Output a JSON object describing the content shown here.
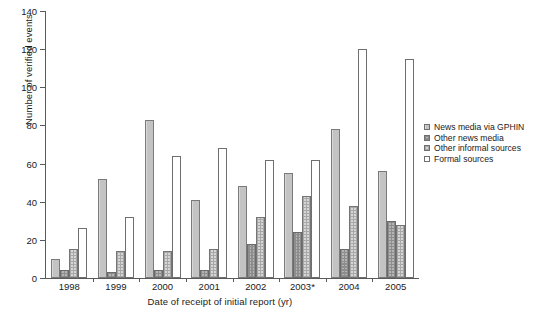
{
  "chart_data": {
    "type": "bar",
    "title": "",
    "xlabel": "Date of receipt of initial report (yr)",
    "ylabel": "Number of verified events",
    "categories": [
      "1998",
      "1999",
      "2000",
      "2001",
      "2002",
      "2003*",
      "2004",
      "2005"
    ],
    "ylim": [
      0,
      140
    ],
    "yticks": [
      0,
      20,
      40,
      60,
      80,
      100,
      120,
      140
    ],
    "grid": false,
    "legend_position": "right",
    "series": [
      {
        "name": "News media via GPHIN",
        "pattern": "solid-gray",
        "color": "#c3c3c3",
        "values": [
          10,
          52,
          83,
          41,
          48,
          55,
          78,
          56
        ]
      },
      {
        "name": "Other news media",
        "pattern": "dark-checkerboard",
        "color": "#8d8d8d",
        "values": [
          4,
          3,
          4,
          4,
          18,
          24,
          15,
          30
        ]
      },
      {
        "name": "Other informal sources",
        "pattern": "light-grid",
        "color": "#d6d6d6",
        "values": [
          15,
          14,
          14,
          15,
          32,
          43,
          38,
          28
        ]
      },
      {
        "name": "Formal sources",
        "pattern": "white-empty",
        "color": "#ffffff",
        "values": [
          26,
          32,
          64,
          68,
          62,
          62,
          120,
          115
        ]
      }
    ]
  }
}
